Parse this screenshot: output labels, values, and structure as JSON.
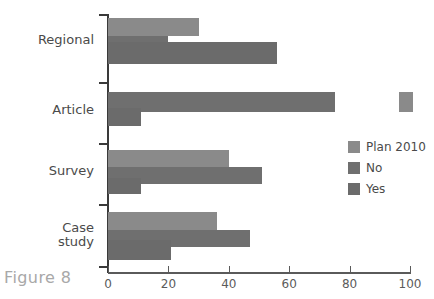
{
  "caption": "Figure 8",
  "chart_data": {
    "type": "bar",
    "orientation": "horizontal",
    "title": "",
    "xlabel": "",
    "ylabel": "",
    "xlim": [
      0,
      100
    ],
    "xticks": [
      0,
      20,
      40,
      60,
      80,
      100
    ],
    "xtick_labels": [
      "0",
      "20",
      "40",
      "60",
      "80",
      "100"
    ],
    "grid": false,
    "legend_position": "right",
    "categories": [
      "Regional",
      "Article",
      "Survey",
      "Case study"
    ],
    "category_label_lines": [
      [
        "Regional"
      ],
      [
        "Article"
      ],
      [
        "Survey"
      ],
      [
        "Case",
        "study"
      ]
    ],
    "series": [
      {
        "name": "Plan 2010",
        "color": "#8a8a8a",
        "values": [
          30,
          100,
          40,
          36
        ]
      },
      {
        "name": "No",
        "color": "#6f6f6f",
        "values": [
          20,
          75,
          51,
          47
        ]
      },
      {
        "name": "Yes",
        "color": "#6b6b6b",
        "values": [
          56,
          11,
          11,
          21
        ]
      }
    ]
  },
  "legend": {
    "items": [
      {
        "label": "Plan 2010",
        "swatch": "plan"
      },
      {
        "label": "No",
        "swatch": "no"
      },
      {
        "label": "Yes",
        "swatch": "yes"
      }
    ]
  },
  "geometry": {
    "x0_px": 108,
    "x100_px": 410,
    "px_per_unit": 3.02,
    "groups": [
      {
        "name": "Regional",
        "bars": [
          {
            "series": "Plan 2010",
            "top": 18,
            "height": 18,
            "value": 30
          },
          {
            "series": "No",
            "top": 36,
            "height": 14,
            "value": 20
          },
          {
            "series": "Yes",
            "top": 42,
            "height": 22,
            "value": 56
          }
        ]
      },
      {
        "name": "Article",
        "bars": [
          {
            "series": "Plan 2010",
            "top": 92,
            "height": 20,
            "value": 100,
            "detached": true,
            "detached_left_px": 399,
            "detached_width_px": 14
          },
          {
            "series": "No",
            "top": 92,
            "height": 20,
            "value": 75
          },
          {
            "series": "Yes",
            "top": 108,
            "height": 18,
            "value": 11
          }
        ]
      },
      {
        "name": "Survey",
        "bars": [
          {
            "series": "Plan 2010",
            "top": 150,
            "height": 17,
            "value": 40
          },
          {
            "series": "No",
            "top": 167,
            "height": 17,
            "value": 51
          },
          {
            "series": "Yes",
            "top": 178,
            "height": 16,
            "value": 11
          }
        ]
      },
      {
        "name": "Case study",
        "bars": [
          {
            "series": "Plan 2010",
            "top": 212,
            "height": 18,
            "value": 36
          },
          {
            "series": "No",
            "top": 230,
            "height": 17,
            "value": 47
          },
          {
            "series": "Yes",
            "top": 240,
            "height": 20,
            "value": 21
          }
        ]
      }
    ],
    "category_label_tops": [
      33,
      103,
      164,
      221
    ],
    "y_tick_tops": [
      14,
      82,
      143,
      204,
      266
    ]
  }
}
